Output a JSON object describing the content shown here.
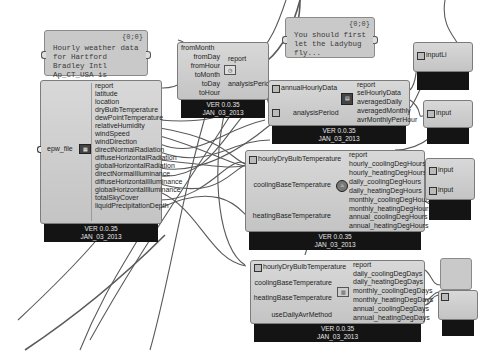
{
  "panels": [
    {
      "id": "panel-weather",
      "header": "{0;0}",
      "text": "Hourly weather data for Hartford Bradley Intl Ap_CT_USA is imported successfully!"
    },
    {
      "id": "panel-ladybug",
      "header": "{0;0}",
      "text": "You should first let the Ladybug fly..."
    }
  ],
  "import_epw": {
    "input": "epw_file",
    "outputs": [
      "report",
      "latitude",
      "location",
      "dryBulbTemperature",
      "dewPointTemperature",
      "relativeHumidity",
      "windSpeed",
      "windDirection",
      "directNormalRadiation",
      "diffuseHorizontalRadiation",
      "globalHorizontalRadiation",
      "directNormalIlluminance",
      "diffuseHorizontalIlluminance",
      "globalHorizontalIlluminance",
      "totalSkyCover",
      "liquidPrecipitationDepth"
    ],
    "version": "VER 0.0.35",
    "date": "JAN_03_2013"
  },
  "analysis_period": {
    "inputs": [
      "fromMonth",
      "fromDay",
      "fromHour",
      "toMonth",
      "toDay",
      "toHour"
    ],
    "outputs": [
      "report",
      "analysisPeriod"
    ],
    "version": "VER 0.0.35",
    "date": "JAN_03_2013"
  },
  "average_data": {
    "inputs": [
      "annualHourlyData",
      "analysisPeriod"
    ],
    "outputs": [
      "report",
      "selHourlyData",
      "averagedDaily",
      "averagedMonthly",
      "avrMonthlyPerHour"
    ],
    "version": "VER 0.0.35",
    "date": "JAN_03_2013"
  },
  "cdh_hdh": {
    "inputs": [
      "hourlyDryBulbTemperature",
      "coolingBaseTemperature",
      "heatingBaseTemperature"
    ],
    "outputs": [
      "report",
      "hourly_coolingDegHours",
      "hourly_heatingDegHours",
      "daily_coolingDegHours",
      "daily_heatingDegHours",
      "monthly_coolingDegHours",
      "monthly_heatingDegHours",
      "annual_coolingDegHours",
      "annual_heatingDegHours"
    ],
    "version": "VER 0.0.35",
    "date": "JAN_03_2013"
  },
  "cdd_hdd": {
    "inputs": [
      "hourlyDryBulbTemperature",
      "coolingBaseTemperature",
      "heatingBaseTemperature",
      "useDailyAvrMethod"
    ],
    "outputs": [
      "report",
      "daily_coolingDegDays",
      "daily_heatingDegDays",
      "monthly_coolingDegDays",
      "monthly_heatingDegDays",
      "annual_coolingDegDays",
      "annual_heatingDegDays"
    ],
    "version": "VER 0.0.35",
    "date": "JAN_03_2013"
  },
  "right_edge": {
    "labels": [
      "inputLi",
      "input",
      "input",
      "input"
    ]
  },
  "colors": {
    "canvas": "#ffffff",
    "component_body": "#cdcdcd",
    "component_footer": "#141414",
    "wire": "#555555",
    "panel": "#c9c9c9"
  }
}
